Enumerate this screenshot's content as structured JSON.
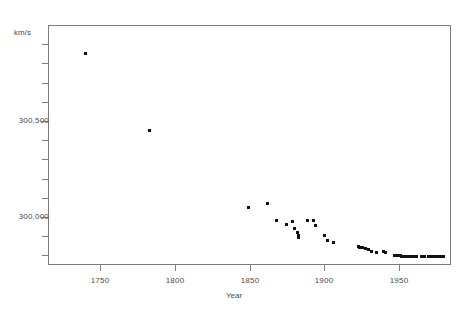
{
  "chart_data": {
    "type": "scatter",
    "title": "",
    "xlabel": "Year",
    "ylabel": "km/s",
    "yunits_label": "km/s",
    "xlim": [
      1715,
      1985
    ],
    "ylim": [
      299750,
      301000
    ],
    "grid": false,
    "legend": "none",
    "xticks": [
      1750,
      1800,
      1850,
      1900,
      1950
    ],
    "xticklabels": [
      "1750",
      "1800",
      "1850",
      "1900",
      "1950"
    ],
    "yticks": [
      300000,
      300500
    ],
    "yticklabels": [
      "300,000",
      "300,500"
    ],
    "yminorticks": [
      299800,
      299900,
      300100,
      300200,
      300300,
      300400,
      300600,
      300700,
      300800,
      300900
    ],
    "marker": "square",
    "marker_color": "#111111",
    "points": [
      {
        "x": 1740,
        "y": 300850
      },
      {
        "x": 1783,
        "y": 300450
      },
      {
        "x": 1849,
        "y": 300050
      },
      {
        "x": 1862,
        "y": 300070
      },
      {
        "x": 1868,
        "y": 299980
      },
      {
        "x": 1875,
        "y": 299960
      },
      {
        "x": 1879,
        "y": 299975
      },
      {
        "x": 1880,
        "y": 299940
      },
      {
        "x": 1882,
        "y": 299920
      },
      {
        "x": 1883,
        "y": 299905
      },
      {
        "x": 1883,
        "y": 299895
      },
      {
        "x": 1889,
        "y": 299980
      },
      {
        "x": 1893,
        "y": 299980
      },
      {
        "x": 1894,
        "y": 299955
      },
      {
        "x": 1900,
        "y": 299905
      },
      {
        "x": 1902,
        "y": 299880
      },
      {
        "x": 1906,
        "y": 299865
      },
      {
        "x": 1923,
        "y": 299845
      },
      {
        "x": 1924,
        "y": 299843
      },
      {
        "x": 1926,
        "y": 299840
      },
      {
        "x": 1928,
        "y": 299838
      },
      {
        "x": 1930,
        "y": 299830
      },
      {
        "x": 1932,
        "y": 299820
      },
      {
        "x": 1935,
        "y": 299815
      },
      {
        "x": 1940,
        "y": 299818
      },
      {
        "x": 1941,
        "y": 299815
      },
      {
        "x": 1947,
        "y": 299800
      },
      {
        "x": 1949,
        "y": 299798
      },
      {
        "x": 1950,
        "y": 299797
      },
      {
        "x": 1951,
        "y": 299797
      },
      {
        "x": 1952,
        "y": 299796
      },
      {
        "x": 1953,
        "y": 299796
      },
      {
        "x": 1954,
        "y": 299795
      },
      {
        "x": 1955,
        "y": 299795
      },
      {
        "x": 1956,
        "y": 299795
      },
      {
        "x": 1958,
        "y": 299795
      },
      {
        "x": 1960,
        "y": 299794
      },
      {
        "x": 1962,
        "y": 299794
      },
      {
        "x": 1965,
        "y": 299793
      },
      {
        "x": 1967,
        "y": 299793
      },
      {
        "x": 1970,
        "y": 299793
      },
      {
        "x": 1972,
        "y": 299793
      },
      {
        "x": 1974,
        "y": 299792
      },
      {
        "x": 1976,
        "y": 299792
      },
      {
        "x": 1978,
        "y": 299792
      },
      {
        "x": 1980,
        "y": 299792
      }
    ]
  }
}
